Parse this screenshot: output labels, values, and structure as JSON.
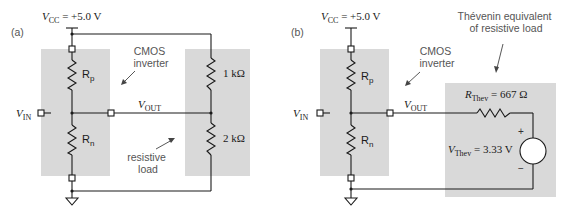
{
  "figure": {
    "panel_a": {
      "label": "(a)",
      "vcc": {
        "symbol": "V",
        "subscript": "CC",
        "value": " = +5.0 V"
      },
      "vin": {
        "symbol": "V",
        "subscript": "IN"
      },
      "vout": {
        "symbol": "V",
        "subscript": "OUT"
      },
      "rp": {
        "symbol": "R",
        "subscript": "p"
      },
      "rn": {
        "symbol": "R",
        "subscript": "n"
      },
      "load_r1": "1 kΩ",
      "load_r2": "2 kΩ",
      "annotation_inverter": [
        "CMOS",
        "inverter"
      ],
      "annotation_load": [
        "resistive",
        "load"
      ]
    },
    "panel_b": {
      "label": "(b)",
      "vcc": {
        "symbol": "V",
        "subscript": "CC",
        "value": " = +5.0 V"
      },
      "vin": {
        "symbol": "V",
        "subscript": "IN"
      },
      "vout": {
        "symbol": "V",
        "subscript": "OUT"
      },
      "rp": {
        "symbol": "R",
        "subscript": "p"
      },
      "rn": {
        "symbol": "R",
        "subscript": "n"
      },
      "rthev": {
        "symbol": "R",
        "subscript": "Thev",
        "value": " = 667 Ω"
      },
      "vthev": {
        "symbol": "V",
        "subscript": "Thev",
        "value": " = 3.33 V"
      },
      "plus": "+",
      "minus": "−",
      "annotation_inverter": [
        "CMOS",
        "inverter"
      ],
      "annotation_thevenin": [
        "Thévenin equivalent",
        "of resistive load"
      ]
    },
    "colors": {
      "block_fill": "#d9d9d9",
      "wire": "#1a1a1a",
      "annotation_text": "#555555"
    }
  }
}
